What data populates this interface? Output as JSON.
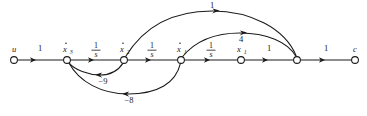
{
  "diagram": {
    "type": "signal-flow-graph",
    "ink_color": "#1a1a1a",
    "background_color": "#ffffff",
    "nodes": [
      {
        "id": "u",
        "label": "u",
        "sub": "",
        "dot": false,
        "x": 14,
        "y": 60,
        "r": 3.4
      },
      {
        "id": "xd3",
        "label": "x",
        "sub": "3",
        "dot": true,
        "x": 67,
        "y": 60,
        "r": 3.4
      },
      {
        "id": "xd2",
        "label": "x",
        "sub": "2",
        "dot": true,
        "x": 124,
        "y": 60,
        "r": 3.4
      },
      {
        "id": "xd1",
        "label": "x",
        "sub": "1",
        "dot": true,
        "x": 181,
        "y": 60,
        "r": 3.4
      },
      {
        "id": "x1",
        "label": "x",
        "sub": "1",
        "dot": false,
        "x": 241,
        "y": 60,
        "r": 3.4
      },
      {
        "id": "n6",
        "label": "",
        "sub": "",
        "dot": false,
        "x": 297,
        "y": 60,
        "r": 3.4
      },
      {
        "id": "c",
        "label": "c",
        "sub": "",
        "dot": false,
        "x": 355,
        "y": 60,
        "r": 3.4
      }
    ],
    "forward_edges": [
      {
        "from": "u",
        "to": "xd3",
        "weight": "1",
        "is_fraction": false,
        "num": "",
        "den": "",
        "label_x": 40,
        "label_y": 51
      },
      {
        "from": "xd3",
        "to": "xd2",
        "weight": "1/s",
        "is_fraction": true,
        "num": "1",
        "den": "s",
        "label_x": 96,
        "label_y": 51
      },
      {
        "from": "xd2",
        "to": "xd1",
        "weight": "1/s",
        "is_fraction": true,
        "num": "1",
        "den": "s",
        "label_x": 152,
        "label_y": 51
      },
      {
        "from": "xd1",
        "to": "x1",
        "weight": "1/s",
        "is_fraction": true,
        "num": "1",
        "den": "s",
        "label_x": 211,
        "label_y": 51
      },
      {
        "from": "x1",
        "to": "n6",
        "weight": "1",
        "is_fraction": false,
        "num": "",
        "den": "",
        "label_x": 269,
        "label_y": 51
      },
      {
        "from": "n6",
        "to": "c",
        "weight": "1",
        "is_fraction": false,
        "num": "",
        "den": "",
        "label_x": 326,
        "label_y": 51
      }
    ],
    "feedback_arcs": [
      {
        "id": "fb-9",
        "from": "xd2",
        "to": "xd3",
        "weight": "−9",
        "label_x": 103,
        "label_y": 81
      },
      {
        "id": "fb-8",
        "from": "xd1",
        "to": "xd3",
        "weight": "−8",
        "label_x": 129,
        "label_y": 101
      }
    ],
    "feedforward_arcs": [
      {
        "id": "ff-1",
        "from": "xd2",
        "to": "n6",
        "weight": "1",
        "label_x": 212,
        "label_y": 12
      },
      {
        "id": "ff-4",
        "from": "xd1",
        "to": "n6",
        "weight": "4",
        "label_x": 241,
        "label_y": 39
      }
    ]
  }
}
